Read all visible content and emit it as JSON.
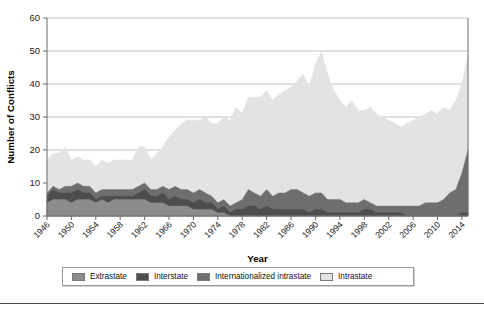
{
  "figure": {
    "background": "#ffffff",
    "bottom_rule_color": "#4a4a4a"
  },
  "axes": {
    "y_title": "Number of Conflicts",
    "x_title": "Year",
    "y_ticks": [
      0,
      10,
      20,
      30,
      40,
      50,
      60
    ],
    "x_ticks": [
      1946,
      1950,
      1954,
      1958,
      1962,
      1966,
      1970,
      1974,
      1978,
      1982,
      1986,
      1990,
      1994,
      1998,
      2002,
      2006,
      2010,
      2014
    ]
  },
  "legend": {
    "position": "bottom",
    "items": [
      {
        "label": "Extrastate",
        "color": "#8c8c8c"
      },
      {
        "label": "Interstate",
        "color": "#4d4d4d"
      },
      {
        "label": "Internationalized intrastate",
        "color": "#6e6e6e"
      },
      {
        "label": "Intrastate",
        "color": "#e3e3e3"
      }
    ]
  },
  "chart_data": {
    "type": "area",
    "stacked": true,
    "title": "",
    "xlabel": "Year",
    "ylabel": "Number of Conflicts",
    "xlim": [
      1946,
      2015
    ],
    "ylim": [
      0,
      60
    ],
    "grid": true,
    "legend_position": "bottom",
    "x": [
      1946,
      1947,
      1948,
      1949,
      1950,
      1951,
      1952,
      1953,
      1954,
      1955,
      1956,
      1957,
      1958,
      1959,
      1960,
      1961,
      1962,
      1963,
      1964,
      1965,
      1966,
      1967,
      1968,
      1969,
      1970,
      1971,
      1972,
      1973,
      1974,
      1975,
      1976,
      1977,
      1978,
      1979,
      1980,
      1981,
      1982,
      1983,
      1984,
      1985,
      1986,
      1987,
      1988,
      1989,
      1990,
      1991,
      1992,
      1993,
      1994,
      1995,
      1996,
      1997,
      1998,
      1999,
      2000,
      2001,
      2002,
      2003,
      2004,
      2005,
      2006,
      2007,
      2008,
      2009,
      2010,
      2011,
      2012,
      2013,
      2014,
      2015
    ],
    "series": [
      {
        "name": "Extrastate",
        "color": "#8c8c8c",
        "values": [
          4,
          5,
          5,
          5,
          4,
          5,
          5,
          5,
          4,
          5,
          4,
          5,
          5,
          5,
          5,
          5,
          5,
          4,
          4,
          4,
          3,
          3,
          3,
          3,
          2,
          2,
          2,
          2,
          1,
          1,
          0,
          0,
          0,
          0,
          0,
          0,
          0,
          0,
          0,
          0,
          0,
          0,
          0,
          0,
          0,
          0,
          0,
          0,
          0,
          0,
          0,
          0,
          0,
          0,
          0,
          0,
          0,
          0,
          0,
          0,
          0,
          0,
          0,
          0,
          0,
          0,
          0,
          0,
          0,
          0
        ]
      },
      {
        "name": "Interstate",
        "color": "#4d4d4d",
        "values": [
          2,
          3,
          2,
          2,
          3,
          3,
          2,
          2,
          1,
          1,
          2,
          1,
          1,
          1,
          1,
          2,
          3,
          2,
          2,
          3,
          2,
          3,
          2,
          2,
          2,
          3,
          2,
          2,
          1,
          2,
          1,
          2,
          2,
          3,
          3,
          2,
          3,
          2,
          2,
          2,
          2,
          2,
          2,
          1,
          2,
          2,
          1,
          1,
          1,
          1,
          1,
          1,
          2,
          2,
          1,
          1,
          1,
          1,
          1,
          0,
          0,
          0,
          0,
          0,
          0,
          0,
          0,
          0,
          1,
          1
        ]
      },
      {
        "name": "Internationalized intrastate",
        "color": "#6e6e6e",
        "values": [
          1,
          1,
          1,
          2,
          2,
          2,
          2,
          2,
          2,
          2,
          2,
          2,
          2,
          2,
          2,
          2,
          2,
          2,
          2,
          2,
          3,
          3,
          3,
          3,
          3,
          3,
          3,
          2,
          2,
          2,
          2,
          2,
          3,
          5,
          4,
          4,
          5,
          4,
          5,
          5,
          6,
          6,
          5,
          5,
          5,
          5,
          4,
          4,
          4,
          3,
          3,
          3,
          3,
          2,
          2,
          2,
          2,
          2,
          2,
          3,
          3,
          3,
          4,
          4,
          4,
          5,
          7,
          8,
          12,
          19
        ]
      },
      {
        "name": "Intrastate",
        "color": "#e3e3e3",
        "values": [
          10,
          10,
          11,
          12,
          8,
          8,
          8,
          8,
          8,
          9,
          8,
          9,
          9,
          9,
          9,
          12,
          11,
          9,
          11,
          12,
          16,
          17,
          20,
          21,
          22,
          21,
          23,
          22,
          24,
          25,
          26,
          29,
          26,
          28,
          29,
          30,
          30,
          29,
          30,
          31,
          31,
          33,
          36,
          33,
          39,
          43,
          38,
          33,
          30,
          29,
          31,
          28,
          27,
          29,
          28,
          27,
          26,
          25,
          24,
          25,
          26,
          27,
          27,
          28,
          27,
          28,
          25,
          27,
          27,
          29
        ]
      }
    ]
  }
}
